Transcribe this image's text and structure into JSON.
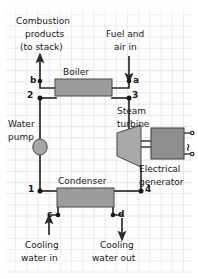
{
  "diagram": {
    "type": "process-flow-diagram",
    "background": {
      "paper": "#fdfdfd",
      "grid_color": "#e7e7ea",
      "grid_spacing_px": 11
    },
    "colors": {
      "line": "#2b2b2b",
      "component_fill": "#9e9e9e",
      "component_fill_light": "#b4b4b4",
      "text": "#1a1a1a"
    },
    "components": [
      {
        "id": "boiler",
        "label": "Boiler",
        "shape": "rectangle"
      },
      {
        "id": "turbine",
        "label": "Steam\nturbine",
        "shape": "trapezoid"
      },
      {
        "id": "generator",
        "label": "Electrical\ngenerator",
        "shape": "rectangle"
      },
      {
        "id": "condenser",
        "label": "Condenser",
        "shape": "rectangle"
      },
      {
        "id": "pump",
        "label": "Water\npump",
        "shape": "circle"
      }
    ],
    "labels": {
      "boiler": "Boiler",
      "steam_turbine_line1": "Steam",
      "steam_turbine_line2": "turbine",
      "electrical_generator_line1": "Electrical",
      "electrical_generator_line2": "generator",
      "condenser": "Condenser",
      "water_pump_line1": "Water",
      "water_pump_line2": "pump",
      "combustion_line1": "Combustion",
      "combustion_line2": "products",
      "combustion_line3": "(to stack)",
      "fuel_line1": "Fuel and",
      "fuel_line2": "air in",
      "cooling_in_line1": "Cooling",
      "cooling_in_line2": "water in",
      "cooling_out_line1": "Cooling",
      "cooling_out_line2": "water out",
      "ac_symbol": "~"
    },
    "state_points": [
      {
        "id": "1",
        "label": "1",
        "desc": "condenser outlet / pump inlet"
      },
      {
        "id": "2",
        "label": "2",
        "desc": "pump outlet / boiler inlet"
      },
      {
        "id": "3",
        "label": "3",
        "desc": "boiler outlet / turbine inlet"
      },
      {
        "id": "4",
        "label": "4",
        "desc": "turbine exhaust / condenser inlet"
      },
      {
        "id": "a",
        "label": "a",
        "desc": "fuel and air in to boiler"
      },
      {
        "id": "b",
        "label": "b",
        "desc": "combustion products to stack"
      },
      {
        "id": "c",
        "label": "c",
        "desc": "cooling water in to condenser"
      },
      {
        "id": "d",
        "label": "d",
        "desc": "cooling water out of condenser"
      }
    ],
    "flows": [
      {
        "from": "a",
        "to": "boiler",
        "name": "fuel-air-in",
        "arrow": "down"
      },
      {
        "from": "boiler",
        "to": "b",
        "name": "combustion-products",
        "arrow": "up"
      },
      {
        "from": "3",
        "to": "turbine",
        "name": "steam-to-turbine",
        "arrow": "none"
      },
      {
        "from": "turbine",
        "to": "4",
        "name": "turbine-exhaust",
        "arrow": "none"
      },
      {
        "from": "4",
        "to": "condenser",
        "name": "to-condenser",
        "arrow": "none"
      },
      {
        "from": "1",
        "to": "pump",
        "name": "to-pump",
        "arrow": "none"
      },
      {
        "from": "pump",
        "to": "2",
        "name": "pump-discharge",
        "arrow": "none"
      },
      {
        "from": "2",
        "to": "boiler",
        "name": "feedwater-to-boiler",
        "arrow": "none"
      },
      {
        "from": "c",
        "to": "condenser",
        "name": "cooling-water-in",
        "arrow": "up"
      },
      {
        "from": "condenser",
        "to": "d",
        "name": "cooling-water-out",
        "arrow": "down"
      }
    ]
  }
}
